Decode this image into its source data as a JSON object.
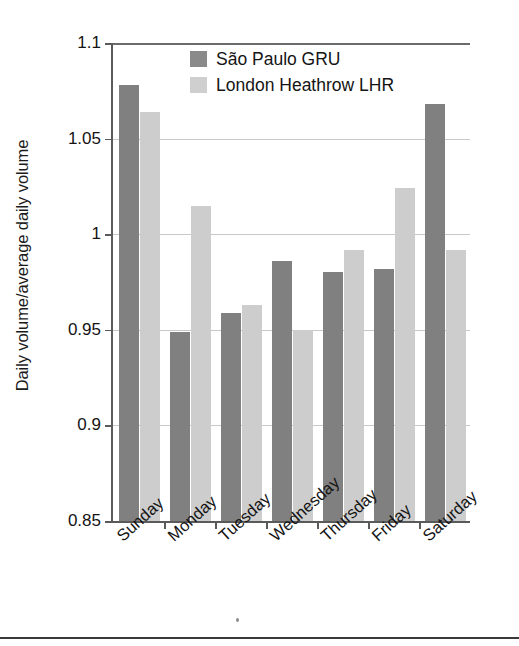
{
  "chart_data": {
    "type": "bar",
    "title": "",
    "xlabel": "",
    "ylabel": "Daily volume/average daily volume",
    "ylim": [
      0.85,
      1.1
    ],
    "yticks": [
      "0.85",
      "0.9",
      "0.95",
      "1",
      "1.05",
      "1.1"
    ],
    "ytick_values": [
      0.85,
      0.9,
      0.95,
      1.0,
      1.05,
      1.1
    ],
    "grid": true,
    "legend_position": "top-center",
    "categories": [
      "Sunday",
      "Monday",
      "Tuesday",
      "Wednesday",
      "Thursday",
      "Friday",
      "Saturday"
    ],
    "series": [
      {
        "name": "São Paulo GRU",
        "color": "#808080",
        "values": [
          1.078,
          0.949,
          0.959,
          0.986,
          0.98,
          0.982,
          1.068
        ]
      },
      {
        "name": "London Heathrow LHR",
        "color": "#cdcdcd",
        "values": [
          1.064,
          1.015,
          0.963,
          0.95,
          0.992,
          1.024,
          0.992
        ]
      }
    ]
  },
  "legend": {
    "items": [
      {
        "label": "São Paulo GRU",
        "swatch": "series-1-swatch"
      },
      {
        "label": "London Heathrow LHR",
        "swatch": "series-2-swatch"
      }
    ]
  }
}
